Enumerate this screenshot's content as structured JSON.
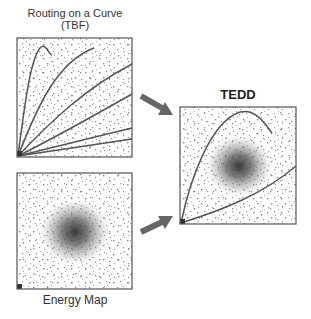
{
  "panels": {
    "tbf": {
      "title_line1": "Routing on a Curve",
      "title_line2": "(TBF)"
    },
    "energy": {
      "title": "Energy Map"
    },
    "tedd": {
      "title": "TEDD"
    }
  },
  "colors": {
    "border": "#555555",
    "curve": "#555555",
    "arrow": "#666666",
    "dots": "#8a8a8a",
    "energy_center": "#333333"
  }
}
